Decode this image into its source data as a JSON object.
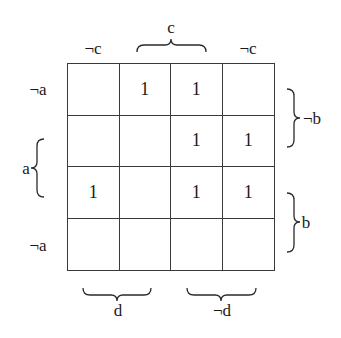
{
  "diagram": {
    "type": "karnaugh-map",
    "column_labels": {
      "left_not_c": "¬c",
      "c": "c",
      "right_not_c": "¬c"
    },
    "row_labels": {
      "top_not_a": "¬a",
      "a": "a",
      "bottom_not_a": "¬a"
    },
    "side_labels": {
      "not_b": "¬b",
      "b": "b"
    },
    "bottom_labels": {
      "d": "d",
      "not_d": "¬d"
    },
    "cells": [
      [
        "",
        "1",
        "1",
        ""
      ],
      [
        "",
        "",
        "1",
        "1"
      ],
      [
        "1",
        "",
        "1",
        "1"
      ],
      [
        "",
        "",
        "",
        ""
      ]
    ]
  }
}
